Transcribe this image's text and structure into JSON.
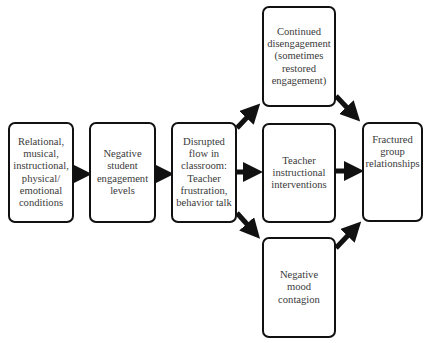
{
  "diagram": {
    "type": "flowchart",
    "direction": "left-to-right",
    "nodes": [
      {
        "id": "conditions",
        "label": "Relational,\nmusical,\ninstructional,\nphysical/\nemotional\nconditions"
      },
      {
        "id": "negative_engagement",
        "label": "Negative\nstudent\nengagement\nlevels"
      },
      {
        "id": "disrupted_flow",
        "label": "Disrupted\nflow in\nclassroom:\nTeacher\nfrustration,\nbehavior talk"
      },
      {
        "id": "continued_disengagement",
        "label": "Continued\ndisengagement\n(sometimes\nrestored\nengagement)"
      },
      {
        "id": "teacher_interventions",
        "label": "Teacher\ninstructional\ninterventions"
      },
      {
        "id": "negative_mood",
        "label": "Negative\nmood\ncontagion"
      },
      {
        "id": "fractured_relationships",
        "label": "Fractured\ngroup\nrelationships"
      }
    ],
    "edges": [
      {
        "from": "conditions",
        "to": "negative_engagement"
      },
      {
        "from": "negative_engagement",
        "to": "disrupted_flow"
      },
      {
        "from": "disrupted_flow",
        "to": "continued_disengagement"
      },
      {
        "from": "disrupted_flow",
        "to": "teacher_interventions"
      },
      {
        "from": "disrupted_flow",
        "to": "negative_mood"
      },
      {
        "from": "continued_disengagement",
        "to": "fractured_relationships"
      },
      {
        "from": "teacher_interventions",
        "to": "fractured_relationships"
      },
      {
        "from": "negative_mood",
        "to": "fractured_relationships"
      }
    ]
  },
  "colors": {
    "border": "#111111",
    "arrow": "#111111",
    "text": "#3a3a3a",
    "background": "#ffffff"
  }
}
